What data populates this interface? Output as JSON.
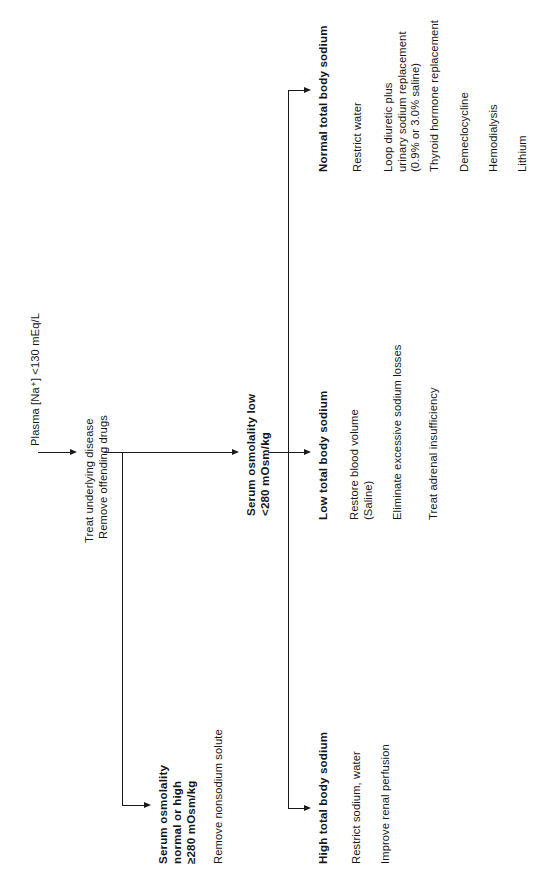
{
  "diagram": {
    "orientation": "rotated-90-ccw",
    "line_color": "#1a1a1a",
    "background": "#ffffff"
  },
  "nodes": {
    "root": {
      "label": "Plasma [Na⁺] <130 mEq/L",
      "bold": false
    },
    "initial_treatment": {
      "line1": "Treat underlying disease",
      "line2": "Remove offending drugs"
    },
    "branch_normal_high_osm": {
      "label": "Serum osmolality\nnormal or high\n≥280 mOsm/kg",
      "bold": true
    },
    "branch_normal_high_osm_action": {
      "label": "Remove nonsodium solute"
    },
    "branch_low_osm": {
      "label": "Serum osmolality low\n<280 mOsm/kg",
      "bold": true
    }
  },
  "columns": [
    {
      "id": "high-total-body-sodium",
      "heading": "High total body sodium",
      "items": [
        "Restrict sodium, water",
        "Improve renal perfusion"
      ]
    },
    {
      "id": "low-total-body-sodium",
      "heading": "Low total body sodium",
      "items": [
        "Restore blood volume\n(Saline)",
        "Eliminate excessive sodium losses",
        "Treat adrenal insufficiency"
      ]
    },
    {
      "id": "normal-total-body-sodium",
      "heading": "Normal total body sodium",
      "items": [
        "Restrict water",
        "Loop diuretic plus\nurinary sodium replacement\n(0.9% or 3.0% saline)",
        "Thyroid hormone replacement",
        "Demeclocycline",
        "Hemodialysis",
        "Lithium"
      ]
    }
  ]
}
